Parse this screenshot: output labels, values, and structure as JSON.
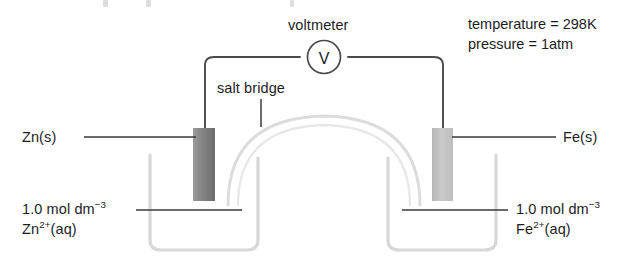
{
  "diagram": {
    "voltmeter": {
      "label": "voltmeter",
      "symbol": "V"
    },
    "salt_bridge": {
      "label": "salt bridge"
    },
    "conditions": {
      "temperature": "temperature = 298K",
      "pressure": "pressure = 1atm"
    },
    "left_cell": {
      "electrode_label": "Zn(s)",
      "solution_concentration": "1.0 mol dm",
      "solution_concentration_exponent": "−3",
      "solution_species": "Zn",
      "solution_species_charge": "2+",
      "solution_species_state": "(aq)"
    },
    "right_cell": {
      "electrode_label": "Fe(s)",
      "solution_concentration": "1.0 mol dm",
      "solution_concentration_exponent": "−3",
      "solution_species": "Fe",
      "solution_species_charge": "2+",
      "solution_species_state": "(aq)"
    },
    "colors": {
      "wire": "#4a4a4a",
      "beaker": "#d8d8d8",
      "salt_bridge": "#dcdcdc",
      "zinc_electrode_dark": "#6f6f6f",
      "zinc_electrode_light": "#9a9a9a",
      "iron_electrode_dark": "#b0b0b0",
      "iron_electrode_light": "#cfcfcf",
      "leader_line": "#3a3a3a",
      "text": "#1d1d1d",
      "background": "#ffffff"
    }
  }
}
